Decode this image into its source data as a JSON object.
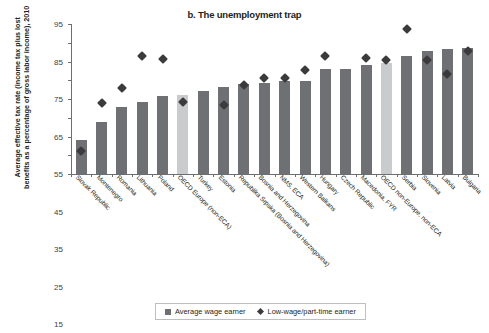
{
  "chart_data": {
    "type": "bar",
    "title": "b. The unemployment trap",
    "xlabel": "",
    "ylabel": "Average effective tax rate (income tax plus lost benefits as a percentage of gross labor income), 2010",
    "ylim": [
      15,
      95
    ],
    "yticks": [
      15,
      25,
      35,
      45,
      55,
      65,
      75,
      85,
      95
    ],
    "grid": false,
    "legend_position": "bottom-center",
    "categories": [
      "Slovak Republic",
      "Montenegro",
      "Romania",
      "Lithuania",
      "Poland",
      "OECD Europe (non-ECA)",
      "Turkey",
      "Estonia",
      "Republika Srpska (Bosnia and Herzegovina)",
      "Bosnia and Herzegovina",
      "NMS, ECA",
      "Western Balkans",
      "Hungary",
      "Czech Republic",
      "Macedonia, FYR",
      "OECD non-Europe, non-ECA",
      "Serbia",
      "Slovenia",
      "Latvia",
      "Bulgaria"
    ],
    "highlighted_categories": [
      "OECD Europe (non-ECA)",
      "OECD non-Europe, non-ECA"
    ],
    "series": [
      {
        "name": "Average wage earner",
        "type": "bar",
        "color": "#6e7073",
        "highlight_color": "#c9cbcd",
        "values": [
          33,
          43,
          51,
          53.5,
          56.5,
          57,
          59.5,
          61.5,
          63,
          63.5,
          64.5,
          64.5,
          71,
          71,
          73,
          74,
          78,
          80.5,
          81.5,
          82
        ]
      },
      {
        "name": "Low-wage/part-time earner",
        "type": "scatter",
        "color": "#3b3b3d",
        "marker": "diamond",
        "values": [
          29,
          55,
          62.5,
          80,
          78,
          55.5,
          null,
          53.5,
          64.5,
          68,
          68,
          72.5,
          80,
          null,
          79,
          77.5,
          94,
          77.5,
          70,
          82.5
        ]
      }
    ]
  },
  "legend": {
    "entries": [
      {
        "label": "Average wage earner",
        "marker": "square"
      },
      {
        "label": "Low-wage/part-time earner",
        "marker": "diamond"
      }
    ]
  },
  "colors": {
    "bar": "#6e7073",
    "bar_highlight": "#c9cbcd",
    "marker": "#3b3b3d",
    "axis": "#6d6e71",
    "text": "#231f20"
  }
}
